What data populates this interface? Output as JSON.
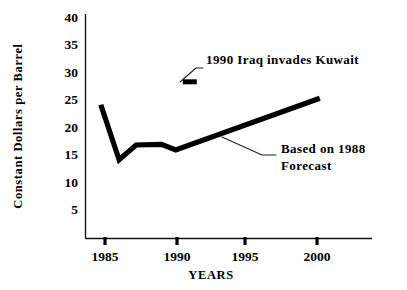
{
  "chart_data": {
    "type": "line",
    "title": "",
    "xlabel": "YEARS",
    "ylabel": "Constant Dollars per Barrel",
    "xlim": [
      1984,
      2001
    ],
    "ylim": [
      0,
      40
    ],
    "grid": false,
    "legend": "none",
    "xticks": [
      "1985",
      "1990",
      "1995",
      "2000"
    ],
    "xtick_values": [
      1985,
      1990,
      1995,
      2000
    ],
    "yticks": [
      "5",
      "10",
      "15",
      "20",
      "25",
      "30",
      "35",
      "40"
    ],
    "ytick_values": [
      5,
      10,
      15,
      20,
      25,
      30,
      35,
      40
    ],
    "series": [
      {
        "name": "Constant dollar oil price",
        "x": [
          1984.7,
          1986.0,
          1987.2,
          1989.0,
          1990.0,
          2000.2
        ],
        "values": [
          24.3,
          14.3,
          17.0,
          17.1,
          16.1,
          25.5
        ]
      }
    ],
    "annotations": [
      {
        "id": "iraq-invasion",
        "text": "1990 Iraq invades Kuwait",
        "marker_x": 1991.0,
        "marker_y": 28.5,
        "marker_type": "filled-rect"
      },
      {
        "id": "forecast-note",
        "text_line1": "Based on 1988",
        "text_line2": "Forecast",
        "points_to_x": 1994.6,
        "points_to_y": 20.4
      }
    ],
    "colors": {
      "line": "#000000",
      "axis": "#111111",
      "text": "#000000",
      "background": "#ffffff"
    }
  }
}
